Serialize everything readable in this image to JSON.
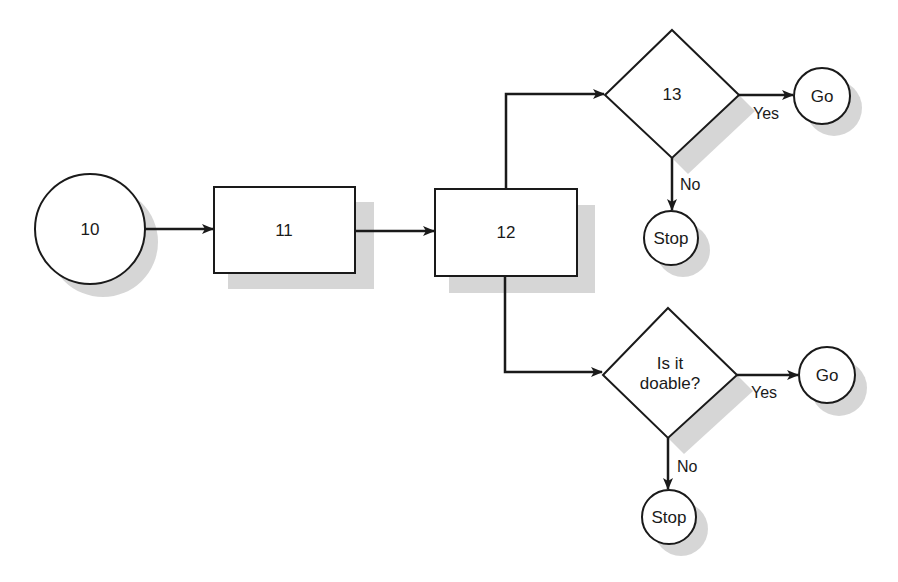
{
  "diagram": {
    "type": "flowchart",
    "colors": {
      "stroke": "#1a1a1a",
      "fill": "#ffffff",
      "shadow": "#c8c8c8",
      "background": "#ffffff"
    },
    "nodes": {
      "n10": {
        "label": "10",
        "shape": "circle"
      },
      "n11": {
        "label": "11",
        "shape": "rectangle"
      },
      "n12": {
        "label": "12",
        "shape": "rectangle"
      },
      "n13": {
        "label": "13",
        "shape": "diamond"
      },
      "go_top": {
        "label": "Go",
        "shape": "circle"
      },
      "stop_top": {
        "label": "Stop",
        "shape": "circle"
      },
      "doable": {
        "label_line1": "Is it",
        "label_line2": "doable?",
        "shape": "diamond"
      },
      "go_bottom": {
        "label": "Go",
        "shape": "circle"
      },
      "stop_bottom": {
        "label": "Stop",
        "shape": "circle"
      }
    },
    "edges": {
      "e13_yes": {
        "label": "Yes"
      },
      "e13_no": {
        "label": "No"
      },
      "doable_yes": {
        "label": "Yes"
      },
      "doable_no": {
        "label": "No"
      }
    }
  }
}
